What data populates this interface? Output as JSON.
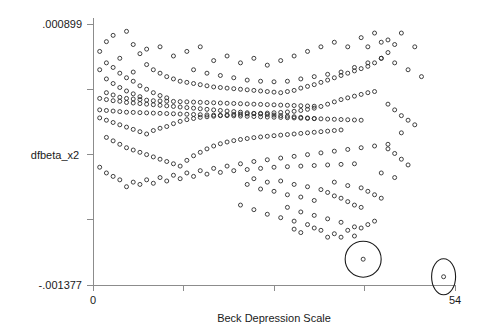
{
  "chart_data": {
    "type": "scatter",
    "title": "",
    "subtitle": "",
    "xlabel": "Beck Depression Scale",
    "ylabel": "dfbeta_x2",
    "xlim": [
      0,
      54
    ],
    "ylim": [
      -0.001377,
      0.000899
    ],
    "x_tick_labels": [
      "0",
      "54"
    ],
    "y_tick_labels": [
      ".000899",
      "-.001377"
    ],
    "x_tick_values": [
      0,
      54
    ],
    "y_tick_values": [
      0.000899,
      -0.001377
    ],
    "x_minor_tick_values": [
      0,
      13.5,
      27,
      40.5,
      54
    ],
    "y_minor_tick_values": [
      0.000899,
      0.00033,
      -0.000239,
      -0.000808,
      -0.001377
    ],
    "grid": false,
    "legend": "none",
    "marker": "open-circle",
    "marker_size_px": 4,
    "n_points": 370,
    "annotations": [
      {
        "name": "outlier-circle-large",
        "shape": "circle",
        "x": 40.3,
        "y": -0.001152,
        "radius_px": 18
      },
      {
        "name": "outlier-ellipse-right",
        "shape": "ellipse",
        "x": 52.3,
        "y": -0.001305,
        "rx_px": 12,
        "ry_px": 18
      }
    ],
    "points": [
      [
        1,
        0.00066
      ],
      [
        2,
        0.000745
      ],
      [
        3,
        0.0008
      ],
      [
        4,
        0.0006
      ],
      [
        5,
        0.000835
      ],
      [
        2,
        0.00056
      ],
      [
        1,
        0.0005
      ],
      [
        3,
        0.00052
      ],
      [
        6,
        0.00048
      ],
      [
        4,
        0.00047
      ],
      [
        7,
        0.00064
      ],
      [
        5,
        0.00043
      ],
      [
        2,
        0.00042
      ],
      [
        8,
        0.000545
      ],
      [
        6,
        0.0004
      ],
      [
        3,
        0.00038
      ],
      [
        9,
        0.0005
      ],
      [
        7,
        0.00036
      ],
      [
        4,
        0.000345
      ],
      [
        10,
        0.00047
      ],
      [
        8,
        0.00033
      ],
      [
        5,
        0.000315
      ],
      [
        11,
        0.00044
      ],
      [
        9,
        0.0003
      ],
      [
        6,
        0.00029
      ],
      [
        12,
        0.00042
      ],
      [
        10,
        0.000275
      ],
      [
        7,
        0.000265
      ],
      [
        13,
        0.0004
      ],
      [
        11,
        0.000255
      ],
      [
        1,
        0.00025
      ],
      [
        2,
        0.00024
      ],
      [
        3,
        0.00023
      ],
      [
        4,
        0.000225
      ],
      [
        5,
        0.000215
      ],
      [
        6,
        0.00021
      ],
      [
        7,
        0.000205
      ],
      [
        8,
        0.0002
      ],
      [
        9,
        0.000195
      ],
      [
        10,
        0.00019
      ],
      [
        11,
        0.000185
      ],
      [
        12,
        0.00018
      ],
      [
        13,
        0.000175
      ],
      [
        14,
        0.00039
      ],
      [
        14,
        0.00017
      ],
      [
        15,
        0.00038
      ],
      [
        15,
        0.000165
      ],
      [
        16,
        0.00037
      ],
      [
        16,
        0.00016
      ],
      [
        17,
        0.00036
      ],
      [
        17,
        0.000155
      ],
      [
        18,
        0.00035
      ],
      [
        18,
        0.00015
      ],
      [
        19,
        0.000345
      ],
      [
        19,
        0.000145
      ],
      [
        20,
        0.00034
      ],
      [
        20,
        0.00014
      ],
      [
        21,
        0.000335
      ],
      [
        21,
        0.000135
      ],
      [
        22,
        0.00033
      ],
      [
        22,
        0.00013
      ],
      [
        23,
        0.000325
      ],
      [
        23,
        0.000125
      ],
      [
        24,
        0.00032
      ],
      [
        24,
        0.00012
      ],
      [
        25,
        0.000315
      ],
      [
        25,
        0.000115
      ],
      [
        26,
        0.00031
      ],
      [
        26,
        0.00011
      ],
      [
        27,
        0.000305
      ],
      [
        27,
        0.000105
      ],
      [
        28,
        0.0003
      ],
      [
        28,
        0.0001
      ],
      [
        29,
        0.00031
      ],
      [
        29,
        9.5e-05
      ],
      [
        30,
        0.00032
      ],
      [
        30,
        9e-05
      ],
      [
        31,
        0.00034
      ],
      [
        31,
        8.5e-05
      ],
      [
        32,
        0.000355
      ],
      [
        32,
        8e-05
      ],
      [
        33,
        0.00037
      ],
      [
        33,
        7.5e-05
      ],
      [
        1,
        8e-05
      ],
      [
        2,
        6e-05
      ],
      [
        3,
        4e-05
      ],
      [
        4,
        2e-05
      ],
      [
        5,
        0.0
      ],
      [
        6,
        -2e-05
      ],
      [
        7,
        -4e-05
      ],
      [
        8,
        -6e-05
      ],
      [
        9,
        -3e-05
      ],
      [
        10,
        -1e-05
      ],
      [
        11,
        5e-06
      ],
      [
        12,
        3e-05
      ],
      [
        13,
        5e-05
      ],
      [
        14,
        6.5e-05
      ],
      [
        15,
        7.5e-05
      ],
      [
        16,
        8.5e-05
      ],
      [
        17,
        9e-05
      ],
      [
        18,
        9.5e-05
      ],
      [
        19,
        0.0001
      ],
      [
        20,
        0.000105
      ],
      [
        21,
        0.00011
      ],
      [
        22,
        0.000112
      ],
      [
        23,
        0.000115
      ],
      [
        24,
        0.000118
      ],
      [
        25,
        0.00012
      ],
      [
        26,
        0.000122
      ],
      [
        27,
        0.000125
      ],
      [
        28,
        0.000128
      ],
      [
        29,
        0.000132
      ],
      [
        30,
        0.000138
      ],
      [
        31,
        0.000145
      ],
      [
        32,
        0.000155
      ],
      [
        33,
        0.000165
      ],
      [
        34,
        0.00018
      ],
      [
        35,
        0.0002
      ],
      [
        36,
        0.00022
      ],
      [
        34,
        0.00039
      ],
      [
        35,
        0.00041
      ],
      [
        36,
        0.00043
      ],
      [
        37,
        0.00045
      ],
      [
        38,
        0.00047
      ],
      [
        39,
        0.00049
      ],
      [
        37,
        0.00024
      ],
      [
        38,
        0.000255
      ],
      [
        39,
        0.00027
      ],
      [
        40,
        0.000285
      ],
      [
        41,
        0.0003
      ],
      [
        42,
        0.00031
      ],
      [
        40,
        0.00051
      ],
      [
        41,
        0.00053
      ],
      [
        42,
        0.00056
      ],
      [
        43,
        0.0006
      ],
      [
        44,
        0.00065
      ],
      [
        45,
        0.00072
      ],
      [
        2,
        -9e-05
      ],
      [
        3,
        -0.00012
      ],
      [
        4,
        -0.00015
      ],
      [
        5,
        -0.00018
      ],
      [
        6,
        -0.0002
      ],
      [
        7,
        -0.00022
      ],
      [
        8,
        -0.00024
      ],
      [
        9,
        -0.00026
      ],
      [
        10,
        -0.00028
      ],
      [
        11,
        -0.0003
      ],
      [
        12,
        -0.00032
      ],
      [
        13,
        -0.00034
      ],
      [
        14,
        -0.00029
      ],
      [
        15,
        -0.00025
      ],
      [
        16,
        -0.00022
      ],
      [
        17,
        -0.00019
      ],
      [
        18,
        -0.000165
      ],
      [
        19,
        -0.000145
      ],
      [
        20,
        -0.00013
      ],
      [
        21,
        -0.000118
      ],
      [
        22,
        -0.000108
      ],
      [
        23,
        -0.0001
      ],
      [
        24,
        -9.2e-05
      ],
      [
        25,
        -8.6e-05
      ],
      [
        26,
        -8e-05
      ],
      [
        27,
        -7.5e-05
      ],
      [
        28,
        -7e-05
      ],
      [
        29,
        -6.5e-05
      ],
      [
        30,
        -6e-05
      ],
      [
        31,
        -5.5e-05
      ],
      [
        32,
        -5e-05
      ],
      [
        33,
        -4.5e-05
      ],
      [
        34,
        -4e-05
      ],
      [
        35,
        -3.5e-05
      ],
      [
        36,
        -3e-05
      ],
      [
        37,
        -2.5e-05
      ],
      [
        1,
        -0.00035
      ],
      [
        2,
        -0.0004
      ],
      [
        3,
        -0.00043
      ],
      [
        4,
        -0.00046
      ],
      [
        6,
        -0.00048
      ],
      [
        8,
        -0.00046
      ],
      [
        10,
        -0.00044
      ],
      [
        12,
        -0.00042
      ],
      [
        14,
        -0.0004
      ],
      [
        16,
        -0.00038
      ],
      [
        18,
        -0.00036
      ],
      [
        20,
        -0.00034
      ],
      [
        22,
        -0.00032
      ],
      [
        24,
        -0.0003
      ],
      [
        26,
        -0.000285
      ],
      [
        28,
        -0.00027
      ],
      [
        30,
        -0.000255
      ],
      [
        32,
        -0.00024
      ],
      [
        34,
        -0.000225
      ],
      [
        36,
        -0.00021
      ],
      [
        38,
        -0.000195
      ],
      [
        40,
        -0.00018
      ],
      [
        42,
        -0.000165
      ],
      [
        44,
        -0.00015
      ],
      [
        23,
        -0.0005
      ],
      [
        25,
        -0.00054
      ],
      [
        27,
        -0.00056
      ],
      [
        29,
        -0.00059
      ],
      [
        31,
        -0.00061
      ],
      [
        33,
        -0.00064
      ],
      [
        24,
        -0.00045
      ],
      [
        26,
        -0.00048
      ],
      [
        28,
        -0.00047
      ],
      [
        30,
        -0.0005
      ],
      [
        32,
        -0.00052
      ],
      [
        34,
        -0.000545
      ],
      [
        35,
        -0.00057
      ],
      [
        36,
        -0.0006
      ],
      [
        37,
        -0.00062
      ],
      [
        38,
        -0.00065
      ],
      [
        39,
        -0.00068
      ],
      [
        40,
        -0.0007
      ],
      [
        36,
        -0.00048
      ],
      [
        38,
        -0.00051
      ],
      [
        40,
        -0.00053
      ],
      [
        41,
        -0.00056
      ],
      [
        42,
        -0.00059
      ],
      [
        43,
        -0.00062
      ],
      [
        22,
        -0.00068
      ],
      [
        24,
        -0.00072
      ],
      [
        26,
        -0.00076
      ],
      [
        28,
        -0.00079
      ],
      [
        30,
        -0.00082
      ],
      [
        32,
        -0.00085
      ],
      [
        29,
        -0.0007
      ],
      [
        31,
        -0.00074
      ],
      [
        33,
        -0.00077
      ],
      [
        35,
        -0.0008
      ],
      [
        37,
        -0.00083
      ],
      [
        39,
        -0.00087
      ],
      [
        44,
        -0.00019
      ],
      [
        45,
        -0.00023
      ],
      [
        46,
        -0.00028
      ],
      [
        47,
        -0.00033
      ],
      [
        43,
        -0.0004
      ],
      [
        45,
        -0.00044
      ],
      [
        46,
        0.0001
      ],
      [
        47,
        6e-05
      ],
      [
        48,
        2e-05
      ],
      [
        44,
        0.0002
      ],
      [
        45,
        0.00015
      ],
      [
        46,
        -5e-05
      ],
      [
        12,
        0.00062
      ],
      [
        14,
        0.00066
      ],
      [
        16,
        0.0007
      ],
      [
        10,
        0.0007
      ],
      [
        8,
        0.00068
      ],
      [
        6,
        0.00072
      ],
      [
        18,
        0.00058
      ],
      [
        20,
        0.00062
      ],
      [
        22,
        0.00056
      ],
      [
        24,
        0.0006
      ],
      [
        26,
        0.00054
      ],
      [
        28,
        0.00058
      ],
      [
        30,
        0.00062
      ],
      [
        32,
        0.00066
      ],
      [
        34,
        0.0007
      ],
      [
        36,
        0.00074
      ],
      [
        38,
        0.0007
      ],
      [
        40,
        0.00078
      ],
      [
        42,
        0.00082
      ],
      [
        44,
        0.00076
      ],
      [
        46,
        0.00082
      ],
      [
        48,
        0.0007
      ],
      [
        41,
        0.0007
      ],
      [
        43,
        0.00074
      ],
      [
        15,
        0.0005
      ],
      [
        17,
        0.00047
      ],
      [
        19,
        0.00045
      ],
      [
        21,
        0.00043
      ],
      [
        23,
        0.00041
      ],
      [
        25,
        0.0004
      ],
      [
        27,
        0.000395
      ],
      [
        29,
        0.0004
      ],
      [
        31,
        0.00042
      ],
      [
        33,
        0.00044
      ],
      [
        35,
        0.00046
      ],
      [
        37,
        0.00048
      ],
      [
        39,
        0.00052
      ],
      [
        41,
        0.00056
      ],
      [
        43,
        0.0006
      ],
      [
        45,
        0.00056
      ],
      [
        47,
        0.0005
      ],
      [
        49,
        0.00044
      ],
      [
        5,
        -0.00052
      ],
      [
        7,
        -0.0005
      ],
      [
        9,
        -0.00049
      ],
      [
        11,
        -0.00047
      ],
      [
        13,
        -0.00045
      ],
      [
        15,
        -0.00043
      ],
      [
        17,
        -0.00041
      ],
      [
        19,
        -0.000395
      ],
      [
        21,
        -0.00038
      ],
      [
        23,
        -0.00037
      ],
      [
        25,
        -0.00036
      ],
      [
        27,
        -0.00035
      ],
      [
        29,
        -0.000345
      ],
      [
        31,
        -0.00034
      ],
      [
        33,
        -0.000335
      ],
      [
        35,
        -0.00033
      ],
      [
        37,
        -0.000325
      ],
      [
        39,
        -0.00032
      ],
      [
        40.3,
        -0.001152
      ],
      [
        52.3,
        -0.001305
      ],
      [
        34,
        -0.0009
      ],
      [
        36,
        -0.00093
      ],
      [
        33,
        -0.00088
      ],
      [
        31,
        -0.00092
      ],
      [
        35,
        -0.00096
      ],
      [
        30,
        -0.00089
      ],
      [
        38,
        -0.0009
      ],
      [
        39,
        -0.00095
      ],
      [
        37,
        -0.00096
      ],
      [
        40,
        -0.00088
      ],
      [
        41,
        -0.00085
      ],
      [
        42,
        -0.00082
      ],
      [
        2,
        0.0003
      ],
      [
        3,
        0.00028
      ],
      [
        4,
        0.00026
      ],
      [
        5,
        0.00025
      ],
      [
        6,
        0.000245
      ],
      [
        7,
        0.00024
      ],
      [
        8,
        0.000235
      ],
      [
        9,
        0.00023
      ],
      [
        10,
        0.000228
      ],
      [
        11,
        0.000226
      ],
      [
        12,
        0.000224
      ],
      [
        13,
        0.000222
      ],
      [
        14,
        0.00022
      ],
      [
        15,
        0.000218
      ],
      [
        16,
        0.000216
      ],
      [
        17,
        0.000214
      ],
      [
        18,
        0.000212
      ],
      [
        19,
        0.00021
      ],
      [
        20,
        0.000208
      ],
      [
        21,
        0.000206
      ],
      [
        22,
        0.000204
      ],
      [
        23,
        0.000202
      ],
      [
        24,
        0.0002
      ],
      [
        25,
        0.000198
      ],
      [
        26,
        0.000196
      ],
      [
        27,
        0.000194
      ],
      [
        28,
        0.000192
      ],
      [
        29,
        0.00019
      ],
      [
        30,
        0.000188
      ],
      [
        31,
        0.000186
      ],
      [
        32,
        0.000184
      ],
      [
        33,
        0.000182
      ],
      [
        1,
        0.00015
      ],
      [
        2,
        0.000145
      ],
      [
        3,
        0.00014
      ],
      [
        4,
        0.000135
      ],
      [
        5,
        0.00013
      ],
      [
        6,
        0.000128
      ],
      [
        7,
        0.000126
      ],
      [
        8,
        0.000124
      ],
      [
        9,
        0.000122
      ],
      [
        10,
        0.00012
      ],
      [
        11,
        0.000118
      ],
      [
        12,
        0.000116
      ],
      [
        13,
        0.000114
      ],
      [
        14,
        0.000112
      ],
      [
        15,
        0.00011
      ],
      [
        16,
        0.000108
      ],
      [
        17,
        0.000106
      ],
      [
        18,
        0.000104
      ],
      [
        19,
        0.000102
      ],
      [
        20,
        0.0001
      ],
      [
        21,
        9.8e-05
      ],
      [
        22,
        9.6e-05
      ],
      [
        23,
        9.4e-05
      ],
      [
        24,
        9.2e-05
      ],
      [
        25,
        9e-05
      ],
      [
        26,
        8.8e-05
      ],
      [
        27,
        8.6e-05
      ],
      [
        28,
        8.4e-05
      ],
      [
        29,
        8.2e-05
      ],
      [
        30,
        8e-05
      ],
      [
        31,
        7.8e-05
      ],
      [
        32,
        7.6e-05
      ],
      [
        33,
        7.4e-05
      ],
      [
        34,
        7.2e-05
      ],
      [
        35,
        7e-05
      ],
      [
        36,
        6.8e-05
      ],
      [
        37,
        6.6e-05
      ],
      [
        38,
        6.4e-05
      ],
      [
        39,
        6.2e-05
      ],
      [
        40,
        6e-05
      ]
    ]
  },
  "axes": {
    "y_top_label": ".000899",
    "y_bottom_label": "-.001377",
    "y_title": "dfbeta_x2",
    "x_left_label": "0",
    "x_right_label": "54",
    "x_title": "Beck Depression Scale"
  }
}
